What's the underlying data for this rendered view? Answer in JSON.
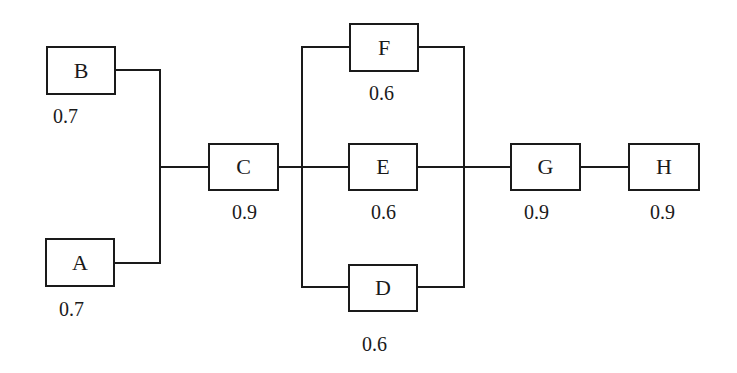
{
  "diagram": {
    "type": "reliability-block-diagram",
    "components": [
      {
        "id": "B",
        "label": "B",
        "reliability": "0.7"
      },
      {
        "id": "A",
        "label": "A",
        "reliability": "0.7"
      },
      {
        "id": "C",
        "label": "C",
        "reliability": "0.9"
      },
      {
        "id": "F",
        "label": "F",
        "reliability": "0.6"
      },
      {
        "id": "E",
        "label": "E",
        "reliability": "0.6"
      },
      {
        "id": "D",
        "label": "D",
        "reliability": "0.6"
      },
      {
        "id": "G",
        "label": "G",
        "reliability": "0.9"
      },
      {
        "id": "H",
        "label": "H",
        "reliability": "0.9"
      }
    ],
    "structure": "(A || B) -> C -> (F || E || D) -> G -> H"
  }
}
